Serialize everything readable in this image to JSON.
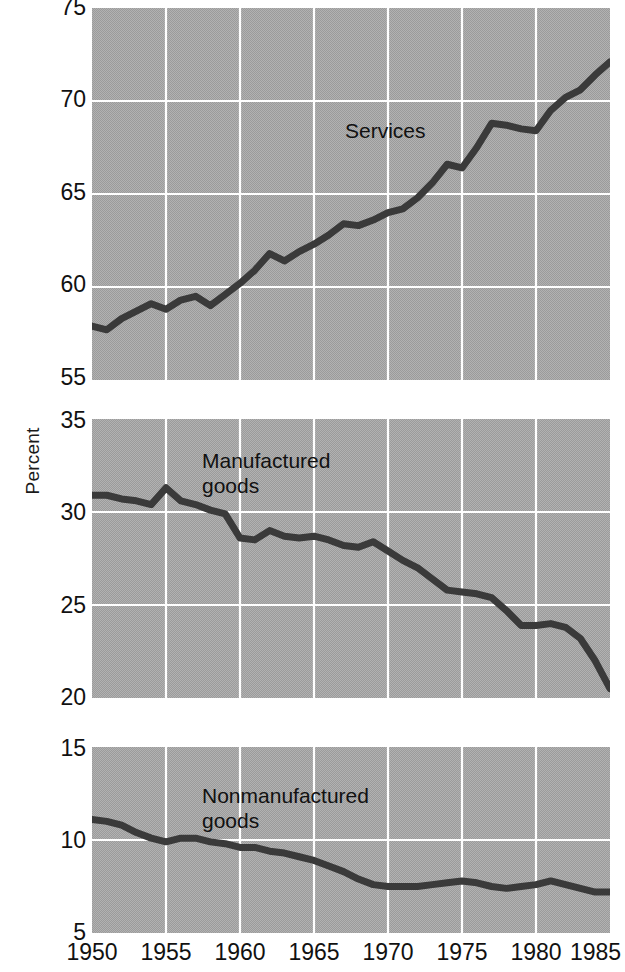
{
  "chart_data": [
    {
      "type": "line",
      "panel": "services",
      "title": "Services",
      "xlabel": "",
      "ylabel": "Percent",
      "xlim": [
        1950,
        1985
      ],
      "ylim": [
        55,
        75
      ],
      "yticks": [
        55,
        60,
        65,
        70,
        75
      ],
      "xticks": [
        1950,
        1955,
        1960,
        1965,
        1970,
        1975,
        1980,
        1985
      ],
      "grid": true,
      "legend": "none",
      "x": [
        1950,
        1951,
        1952,
        1953,
        1954,
        1955,
        1956,
        1957,
        1958,
        1959,
        1960,
        1961,
        1962,
        1963,
        1964,
        1965,
        1966,
        1967,
        1968,
        1969,
        1970,
        1971,
        1972,
        1973,
        1974,
        1975,
        1976,
        1977,
        1978,
        1979,
        1980,
        1981,
        1982,
        1983,
        1984,
        1985
      ],
      "values": [
        57.9,
        57.7,
        58.3,
        58.7,
        59.1,
        58.8,
        59.3,
        59.5,
        59.0,
        59.6,
        60.2,
        60.9,
        61.8,
        61.4,
        61.9,
        62.3,
        62.8,
        63.4,
        63.3,
        63.6,
        64.0,
        64.2,
        64.8,
        65.6,
        66.6,
        66.4,
        67.5,
        68.8,
        68.7,
        68.5,
        68.4,
        69.5,
        70.2,
        70.6,
        71.4,
        72.1
      ]
    },
    {
      "type": "line",
      "panel": "manufactured-goods",
      "title": "Manufactured goods",
      "xlabel": "",
      "ylabel": "Percent",
      "xlim": [
        1950,
        1985
      ],
      "ylim": [
        20,
        35
      ],
      "yticks": [
        20,
        25,
        30,
        35
      ],
      "xticks": [
        1950,
        1955,
        1960,
        1965,
        1970,
        1975,
        1980,
        1985
      ],
      "grid": true,
      "legend": "none",
      "x": [
        1950,
        1951,
        1952,
        1953,
        1954,
        1955,
        1956,
        1957,
        1958,
        1959,
        1960,
        1961,
        1962,
        1963,
        1964,
        1965,
        1966,
        1967,
        1968,
        1969,
        1970,
        1971,
        1972,
        1973,
        1974,
        1975,
        1976,
        1977,
        1978,
        1979,
        1980,
        1981,
        1982,
        1983,
        1984,
        1985
      ],
      "values": [
        30.9,
        30.9,
        30.7,
        30.6,
        30.4,
        31.3,
        30.6,
        30.4,
        30.1,
        29.9,
        28.6,
        28.5,
        29.0,
        28.7,
        28.6,
        28.7,
        28.5,
        28.2,
        28.1,
        28.4,
        27.9,
        27.4,
        27.0,
        26.4,
        25.8,
        25.7,
        25.6,
        25.4,
        24.7,
        23.9,
        23.9,
        24.0,
        23.8,
        23.2,
        22.0,
        20.5
      ]
    },
    {
      "type": "line",
      "panel": "nonmanufactured-goods",
      "title": "Nonmanufactured goods",
      "xlabel": "",
      "ylabel": "Percent",
      "xlim": [
        1950,
        1985
      ],
      "ylim": [
        5,
        15
      ],
      "yticks": [
        5,
        10,
        15
      ],
      "xticks": [
        1950,
        1955,
        1960,
        1965,
        1970,
        1975,
        1980,
        1985
      ],
      "grid": true,
      "legend": "none",
      "x": [
        1950,
        1951,
        1952,
        1953,
        1954,
        1955,
        1956,
        1957,
        1958,
        1959,
        1960,
        1961,
        1962,
        1963,
        1964,
        1965,
        1966,
        1967,
        1968,
        1969,
        1970,
        1971,
        1972,
        1973,
        1974,
        1975,
        1976,
        1977,
        1978,
        1979,
        1980,
        1981,
        1982,
        1983,
        1984,
        1985
      ],
      "values": [
        11.1,
        11.0,
        10.8,
        10.4,
        10.1,
        9.9,
        10.1,
        10.1,
        9.9,
        9.8,
        9.6,
        9.6,
        9.4,
        9.3,
        9.1,
        8.9,
        8.6,
        8.3,
        7.9,
        7.6,
        7.5,
        7.5,
        7.5,
        7.6,
        7.7,
        7.8,
        7.7,
        7.5,
        7.4,
        7.5,
        7.6,
        7.8,
        7.6,
        7.4,
        7.2,
        7.2
      ]
    }
  ],
  "axis": {
    "ylabel": "Percent",
    "xticklabels": [
      "1950",
      "1955",
      "1960",
      "1965",
      "1970",
      "1975",
      "1980",
      "1985"
    ],
    "panel1_yticklabels": [
      "75",
      "70",
      "65",
      "60",
      "55"
    ],
    "panel2_yticklabels": [
      "35",
      "30",
      "25",
      "20"
    ],
    "panel3_yticklabels": [
      "15",
      "10",
      "5"
    ]
  },
  "annotations": {
    "panel1_label": "Services",
    "panel2_label": "Manufactured\ngoods",
    "panel3_label": "Nonmanufactured\ngoods"
  },
  "colors": {
    "plot_background": "#a9a9a9",
    "grid": "#ffffff",
    "line": "#3a3a3a",
    "text": "#111111",
    "page_background": "#ffffff"
  }
}
